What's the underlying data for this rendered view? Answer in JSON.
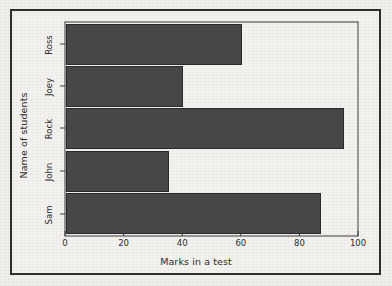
{
  "chart_data": {
    "type": "bar",
    "orientation": "horizontal",
    "title": "",
    "xlabel": "Marks in a test",
    "ylabel": "Name of students",
    "categories": [
      "Sam",
      "John",
      "Rock",
      "Joey",
      "Ross"
    ],
    "values": [
      87,
      35,
      95,
      40,
      60
    ],
    "xlim": [
      0,
      100
    ],
    "xticks": [
      0,
      20,
      40,
      60,
      80,
      100
    ],
    "xtick_labels": [
      "0",
      "20",
      "40",
      "60",
      "80",
      "100"
    ],
    "grid": false,
    "legend": null,
    "bar_color": "#474747",
    "bar_edge_color": "#2a2a2a",
    "frame_color": "#2e2e2e",
    "background_color": "#f1efec"
  }
}
